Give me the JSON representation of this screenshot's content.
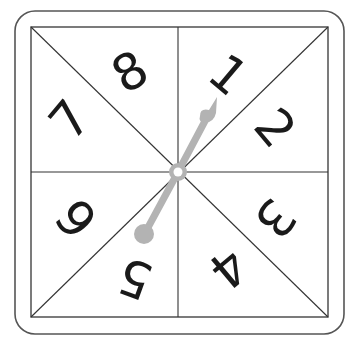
{
  "spinner": {
    "title": "Number spinner 1-8",
    "sectors": [
      {
        "label": "1",
        "x": 228,
        "y": 75,
        "rotate": 40
      },
      {
        "label": "2",
        "x": 275,
        "y": 128,
        "rotate": 50
      },
      {
        "label": "3",
        "x": 275,
        "y": 218,
        "rotate": 130
      },
      {
        "label": "4",
        "x": 228,
        "y": 268,
        "rotate": 140
      },
      {
        "label": "5",
        "x": 135,
        "y": 278,
        "rotate": 200
      },
      {
        "label": "6",
        "x": 77,
        "y": 218,
        "rotate": 230
      },
      {
        "label": "7",
        "x": 70,
        "y": 120,
        "rotate": -50
      },
      {
        "label": "8",
        "x": 130,
        "y": 72,
        "rotate": -30
      }
    ],
    "pointer_target": "1",
    "colors": {
      "frame": "#555555",
      "lines": "#333333",
      "digits": "#1a1a1a",
      "needle": "#b3b3b3",
      "background": "#ffffff"
    }
  }
}
